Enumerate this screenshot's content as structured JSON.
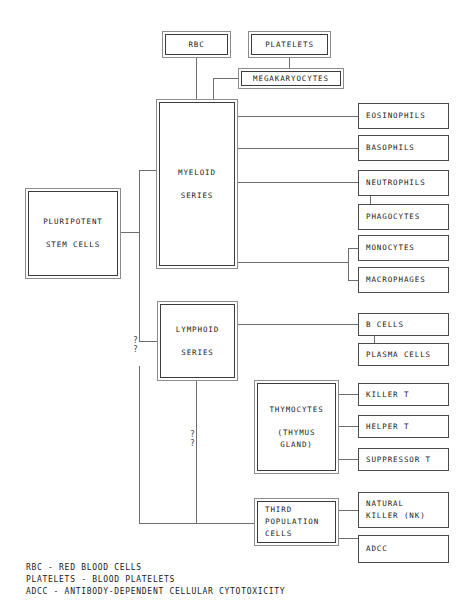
{
  "diagram": {
    "nodes": {
      "rbc": {
        "label": "RBC"
      },
      "platelets": {
        "label": "PLATELETS"
      },
      "megakaryocytes": {
        "label": "MEGAKARYOCYTES"
      },
      "pluripotent": {
        "line1": "PLURIPOTENT",
        "line2": "STEM CELLS"
      },
      "myeloid": {
        "line1": "MYELOID",
        "line2": "SERIES"
      },
      "lymphoid": {
        "line1": "LYMPHOID",
        "line2": "SERIES"
      },
      "eosinophils": {
        "label": "EOSINOPHILS"
      },
      "basophils": {
        "label": "BASOPHILS"
      },
      "neutrophils": {
        "label": "NEUTROPHILS"
      },
      "phagocytes": {
        "label": "PHAGOCYTES"
      },
      "monocytes": {
        "label": "MONOCYTES"
      },
      "macrophages": {
        "label": "MACROPHAGES"
      },
      "bcells": {
        "label": "B CELLS"
      },
      "plasmacells": {
        "label": "PLASMA CELLS"
      },
      "thymocytes": {
        "line1": "THYMOCYTES",
        "line2": "(THYMUS",
        "line3": "GLAND)"
      },
      "killert": {
        "label": "KILLER T"
      },
      "helpert": {
        "label": "HELPER T"
      },
      "suppressort": {
        "label": "SUPPRESSOR T"
      },
      "thirdpop": {
        "line1": "THIRD",
        "line2": "POPULATION",
        "line3": "CELLS"
      },
      "naturalkiller": {
        "line1": "NATURAL",
        "line2": "KILLER (NK)"
      },
      "adcc": {
        "label": "ADCC"
      }
    },
    "uncertain_markers": {
      "stem_to_third": "?\n?",
      "lymphoid_to_third": "?\n?"
    },
    "legend": {
      "line1": "RBC - RED BLOOD CELLS",
      "line2": "PLATELETS - BLOOD PLATELETS",
      "line3": "ADCC - ANTIBODY-DEPENDENT CELLULAR CYTOTOXICITY"
    },
    "colors": {
      "background": "#ffffff",
      "box_border": "#3c3c3c",
      "outer_border": "#8c8c8c",
      "connector": "#6e6e6e",
      "text": "#1a1a1a"
    }
  }
}
